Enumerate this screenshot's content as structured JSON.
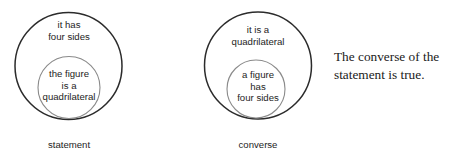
{
  "diagrams": [
    {
      "id": "statement",
      "caption": "statement",
      "outer": {
        "label": "it has\nfour sides",
        "stroke": "#2b2b2b",
        "stroke_width": 1.5,
        "cx": 68.5,
        "cy": 66,
        "r": 53.5
      },
      "inner": {
        "label": "the figure\nis a\nquadrilateral",
        "stroke": "#8a8a8a",
        "stroke_width": 1.1,
        "cx": 69,
        "cy": 87.5,
        "r": 31
      }
    },
    {
      "id": "converse",
      "caption": "converse",
      "outer": {
        "label": "it is a\nquadrilateral",
        "stroke": "#2b2b2b",
        "stroke_width": 1.5,
        "cx": 68,
        "cy": 65.5,
        "r": 53.5
      },
      "inner": {
        "label": "a figure\nhas\nfour sides",
        "stroke": "#8a8a8a",
        "stroke_width": 1.1,
        "cx": 66,
        "cy": 89,
        "r": 29
      }
    }
  ],
  "conclusion": {
    "text": "The converse of the\nstatement is true."
  },
  "colors": {
    "background": "#ffffff",
    "outer_circle_stroke": "#2b2b2b",
    "inner_circle_stroke": "#8a8a8a",
    "text": "#1d1d1d"
  }
}
